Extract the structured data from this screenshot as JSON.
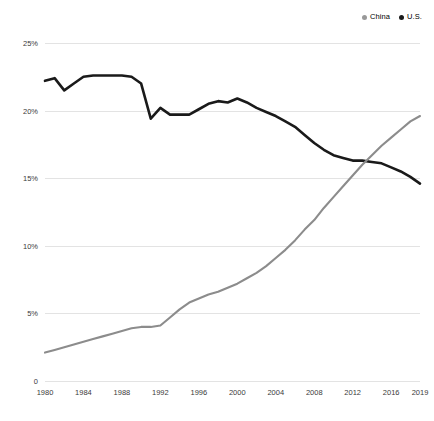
{
  "legend": {
    "position": "top-right",
    "entries": [
      {
        "label": "China",
        "color": "#999999",
        "dot": "legend-dot-china"
      },
      {
        "label": "U.S.",
        "color": "#1a1a1a",
        "dot": "legend-dot-us"
      }
    ]
  },
  "chart_data": {
    "type": "line",
    "title": "",
    "subtitle": "",
    "xlabel": "",
    "ylabel": "",
    "xlim": [
      1980,
      2019
    ],
    "ylim": [
      0,
      25
    ],
    "grid": true,
    "legend_position": "top-right",
    "y_ticks": [
      "0",
      "5%",
      "10%",
      "15%",
      "20%",
      "25%"
    ],
    "y_tick_values": [
      0,
      5,
      10,
      15,
      20,
      25
    ],
    "x_ticks": [
      "1980",
      "1984",
      "1988",
      "1992",
      "1996",
      "2000",
      "2004",
      "2008",
      "2012",
      "2016",
      "2019"
    ],
    "x_tick_values": [
      1980,
      1984,
      1988,
      1992,
      1996,
      2000,
      2004,
      2008,
      2012,
      2016,
      2019
    ],
    "x": [
      1980,
      1981,
      1982,
      1983,
      1984,
      1985,
      1986,
      1987,
      1988,
      1989,
      1990,
      1991,
      1992,
      1993,
      1994,
      1995,
      1996,
      1997,
      1998,
      1999,
      2000,
      2001,
      2002,
      2003,
      2004,
      2005,
      2006,
      2007,
      2008,
      2009,
      2010,
      2011,
      2012,
      2013,
      2014,
      2015,
      2016,
      2017,
      2018,
      2019
    ],
    "series": [
      {
        "name": "U.S.",
        "color": "#1a1a1a",
        "values": [
          22.2,
          22.4,
          21.5,
          22.0,
          22.5,
          22.6,
          22.6,
          22.6,
          22.6,
          22.5,
          22.0,
          19.4,
          20.2,
          19.7,
          19.7,
          19.7,
          20.1,
          20.5,
          20.7,
          20.6,
          20.9,
          20.6,
          20.2,
          19.9,
          19.6,
          19.2,
          18.8,
          18.2,
          17.6,
          17.1,
          16.7,
          16.5,
          16.3,
          16.3,
          16.2,
          16.1,
          15.8,
          15.5,
          15.1,
          14.6
        ]
      },
      {
        "name": "China",
        "color": "#8c8c8c",
        "values": [
          2.1,
          2.3,
          2.5,
          2.7,
          2.9,
          3.1,
          3.3,
          3.5,
          3.7,
          3.9,
          4.0,
          4.0,
          4.1,
          4.7,
          5.3,
          5.8,
          6.1,
          6.4,
          6.6,
          6.9,
          7.2,
          7.6,
          8.0,
          8.5,
          9.1,
          9.7,
          10.4,
          11.2,
          11.9,
          12.8,
          13.6,
          14.4,
          15.2,
          16.0,
          16.7,
          17.4,
          18.0,
          18.6,
          19.2,
          19.6
        ]
      }
    ]
  }
}
